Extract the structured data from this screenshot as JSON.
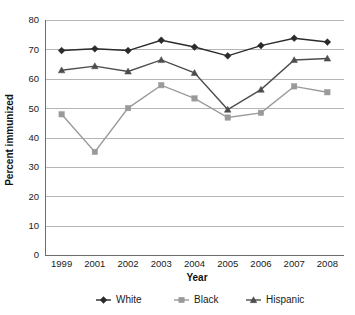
{
  "chart_data": {
    "type": "line",
    "title": "",
    "xlabel": "Year",
    "ylabel": "Percent immunized",
    "categories": [
      "1999",
      "2001",
      "2002",
      "2003",
      "2004",
      "2005",
      "2006",
      "2007",
      "2008"
    ],
    "ylim": [
      0,
      80
    ],
    "yticks": [
      0,
      10,
      20,
      30,
      40,
      50,
      60,
      70,
      80
    ],
    "grid": true,
    "legend_position": "bottom",
    "series": [
      {
        "name": "White",
        "marker": "diamond",
        "color": "#2b2b2b",
        "values": [
          69.6,
          70.2,
          69.6,
          73.1,
          70.8,
          67.8,
          71.3,
          73.8,
          72.5
        ]
      },
      {
        "name": "Black",
        "marker": "square",
        "color": "#9a9a9a",
        "values": [
          47.9,
          35.1,
          50.0,
          57.8,
          53.3,
          46.8,
          48.4,
          57.4,
          55.4
        ]
      },
      {
        "name": "Hispanic",
        "marker": "triangle",
        "color": "#4d4d4d",
        "values": [
          62.9,
          64.3,
          62.5,
          66.4,
          62.0,
          49.5,
          56.3,
          66.4,
          66.9
        ]
      }
    ]
  },
  "legend": {
    "items": [
      {
        "label": "White"
      },
      {
        "label": "Black"
      },
      {
        "label": "Hispanic"
      }
    ]
  },
  "axes": {
    "x_title": "Year",
    "y_title": "Percent immunized"
  }
}
